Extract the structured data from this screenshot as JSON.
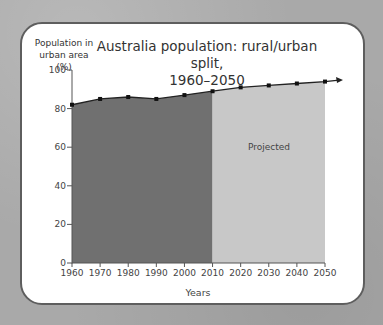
{
  "chart_data": {
    "type": "area",
    "title": "Australia population: rural/urban split, 1960–2050",
    "title_line1": "Australia population: rural/urban split,",
    "title_line2": "1960–2050",
    "ylabel_line1": "Population in",
    "ylabel_line2": "urban area (%)",
    "xlabel": "Years",
    "x": [
      1960,
      1970,
      1980,
      1990,
      2000,
      2010,
      2020,
      2030,
      2040,
      2050
    ],
    "series": [
      {
        "name": "Urban population (%)",
        "values": [
          82,
          85,
          86,
          85,
          87,
          89,
          91,
          92,
          93,
          94
        ]
      }
    ],
    "regions": [
      {
        "label": "Historical",
        "from": 1960,
        "to": 2010,
        "color": "#707070"
      },
      {
        "label": "Projected",
        "from": 2010,
        "to": 2050,
        "color": "#c8c8c8"
      }
    ],
    "annotation": "Projected",
    "yticks": [
      0,
      20,
      40,
      60,
      80,
      100
    ],
    "xticks": [
      1960,
      1970,
      1980,
      1990,
      2000,
      2010,
      2020,
      2030,
      2040,
      2050
    ],
    "ylim": [
      0,
      100
    ],
    "xlim": [
      1960,
      2050
    ],
    "grid": false,
    "legend": "none"
  }
}
